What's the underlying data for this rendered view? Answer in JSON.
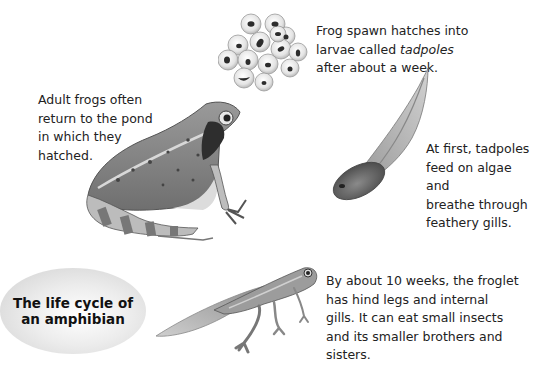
{
  "title": "The life cycle of an amphibian",
  "title_lines": [
    "The life cycle of",
    "an amphibian"
  ],
  "captions": {
    "spawn": {
      "line1": "Frog spawn hatches into",
      "line2_prefix": "larvae called ",
      "line2_italic": "tadpoles",
      "line3": "after about a week."
    },
    "adult": {
      "lines": [
        "Adult frogs often",
        "return to the pond",
        "in which they",
        "hatched."
      ]
    },
    "tadpole": {
      "lines": [
        "At first, tadpoles",
        "feed on algae and",
        "breathe through",
        "feathery gills."
      ]
    },
    "froglet": {
      "lines": [
        "By about 10 weeks, the froglet",
        "has hind legs and internal",
        "gills. It can eat small insects",
        "and its smaller brothers and",
        "sisters."
      ]
    }
  },
  "illustrations": {
    "frog_spawn": "frog-spawn-illustration",
    "adult_frog": "adult-frog-illustration",
    "tadpole": "tadpole-illustration",
    "froglet": "froglet-illustration"
  },
  "colors": {
    "background": "#ffffff",
    "text": "#222222",
    "badge_light": "#ececec",
    "badge_dark": "#cfcfcf"
  }
}
